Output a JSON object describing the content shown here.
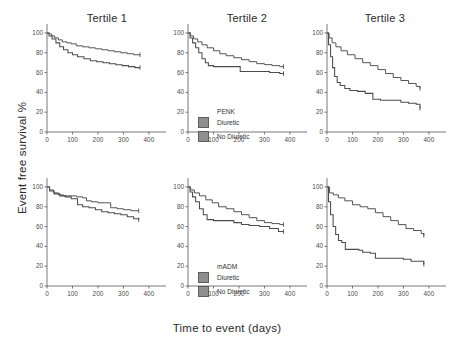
{
  "figure": {
    "xlabel": "Time to event (days)",
    "ylabel": "Event free survival %",
    "panel_titles": [
      "Tertile 1",
      "Tertile 2",
      "Tertile 3"
    ]
  },
  "legends": {
    "top": {
      "title": "PENK",
      "items": [
        {
          "label": "Diuretic",
          "color": "#8f8f8f"
        },
        {
          "label": "No Diuretic",
          "color": "#8f8f8f"
        }
      ]
    },
    "bottom": {
      "title": "mADM",
      "items": [
        {
          "label": "Diuretic",
          "color": "#8f8f8f"
        },
        {
          "label": "No Diuretic",
          "color": "#8f8f8f"
        }
      ]
    }
  },
  "axes": {
    "xticks": [
      0,
      100,
      200,
      300,
      400
    ],
    "xtick_labels": [
      "0",
      "100",
      "200",
      "300",
      "400"
    ],
    "yticks": [
      0,
      20,
      40,
      60,
      80,
      100
    ],
    "ytick_labels": [
      "0",
      "20",
      "40",
      "60",
      "80",
      "100"
    ],
    "xlim": [
      0,
      420
    ],
    "ylim": [
      0,
      105
    ]
  },
  "chart_data": [
    {
      "type": "line",
      "title": "Tertile 1",
      "biomarker": "PENK",
      "row": 0,
      "col": 0,
      "xlabel": "Time to event (days)",
      "ylabel": "Event free survival %",
      "xlim": [
        0,
        420
      ],
      "ylim": [
        0,
        105
      ],
      "grid": false,
      "legend_position": "none",
      "series": [
        {
          "name": "No Diuretic",
          "x": [
            0,
            8,
            18,
            30,
            45,
            60,
            78,
            95,
            115,
            140,
            165,
            190,
            215,
            240,
            265,
            290,
            315,
            340,
            365
          ],
          "y": [
            100,
            99,
            97,
            95,
            93,
            91,
            90,
            89,
            87,
            86,
            85,
            84,
            83,
            82,
            81,
            80,
            79,
            78,
            78
          ]
        },
        {
          "name": "Diuretic",
          "x": [
            0,
            8,
            20,
            35,
            50,
            65,
            82,
            100,
            120,
            145,
            170,
            195,
            220,
            245,
            270,
            295,
            320,
            345,
            365
          ],
          "y": [
            100,
            97,
            94,
            90,
            86,
            83,
            80,
            78,
            76,
            74,
            72,
            71,
            70,
            69,
            68,
            67,
            66,
            65,
            65
          ]
        }
      ]
    },
    {
      "type": "line",
      "title": "Tertile 2",
      "biomarker": "PENK",
      "row": 0,
      "col": 1,
      "xlabel": "Time to event (days)",
      "ylabel": "Event free survival %",
      "xlim": [
        0,
        420
      ],
      "ylim": [
        0,
        105
      ],
      "grid": false,
      "legend_position": "lower-center",
      "series": [
        {
          "name": "No Diuretic",
          "x": [
            0,
            10,
            22,
            38,
            55,
            75,
            100,
            125,
            150,
            180,
            210,
            240,
            270,
            300,
            330,
            360,
            375
          ],
          "y": [
            100,
            97,
            94,
            91,
            88,
            85,
            82,
            79,
            77,
            75,
            73,
            71,
            69,
            68,
            67,
            66,
            66
          ]
        },
        {
          "name": "Diuretic",
          "x": [
            0,
            8,
            18,
            30,
            42,
            55,
            68,
            80,
            100,
            130,
            160,
            190,
            205,
            240,
            280,
            320,
            360,
            375
          ],
          "y": [
            100,
            95,
            90,
            85,
            80,
            74,
            70,
            67,
            66,
            66,
            66,
            66,
            61,
            61,
            61,
            60,
            59,
            59
          ]
        }
      ]
    },
    {
      "type": "line",
      "title": "Tertile 3",
      "biomarker": "PENK",
      "row": 0,
      "col": 2,
      "xlabel": "Time to event (days)",
      "ylabel": "Event free survival %",
      "xlim": [
        0,
        420
      ],
      "ylim": [
        0,
        105
      ],
      "grid": false,
      "legend_position": "none",
      "series": [
        {
          "name": "No Diuretic",
          "x": [
            0,
            8,
            20,
            35,
            55,
            80,
            110,
            140,
            170,
            200,
            230,
            260,
            290,
            320,
            350,
            365
          ],
          "y": [
            100,
            95,
            90,
            86,
            82,
            78,
            74,
            70,
            67,
            63,
            59,
            55,
            52,
            49,
            46,
            44
          ]
        },
        {
          "name": "Diuretic",
          "x": [
            0,
            6,
            14,
            22,
            30,
            40,
            52,
            70,
            90,
            120,
            150,
            180,
            210,
            250,
            290,
            320,
            350,
            365
          ],
          "y": [
            100,
            88,
            76,
            65,
            56,
            50,
            47,
            44,
            42,
            41,
            39,
            33,
            32,
            32,
            30,
            29,
            28,
            24
          ]
        }
      ]
    },
    {
      "type": "line",
      "title": "Tertile 1",
      "biomarker": "mADM",
      "row": 1,
      "col": 0,
      "xlabel": "Time to event (days)",
      "ylabel": "Event free survival %",
      "xlim": [
        0,
        420
      ],
      "ylim": [
        0,
        105
      ],
      "grid": false,
      "legend_position": "none",
      "series": [
        {
          "name": "No Diuretic",
          "x": [
            0,
            10,
            25,
            45,
            65,
            90,
            115,
            140,
            155,
            175,
            200,
            225,
            250,
            275,
            300,
            330,
            360
          ],
          "y": [
            100,
            97,
            94,
            92,
            91,
            91,
            90,
            89,
            86,
            85,
            84,
            84,
            79,
            78,
            77,
            76,
            76
          ]
        },
        {
          "name": "Diuretic",
          "x": [
            0,
            10,
            28,
            50,
            72,
            95,
            120,
            140,
            165,
            190,
            215,
            240,
            265,
            290,
            315,
            340,
            360
          ],
          "y": [
            100,
            96,
            93,
            91,
            90,
            88,
            82,
            80,
            79,
            77,
            75,
            74,
            73,
            72,
            70,
            68,
            67
          ]
        }
      ]
    },
    {
      "type": "line",
      "title": "Tertile 2",
      "biomarker": "mADM",
      "row": 1,
      "col": 1,
      "xlabel": "Time to event (days)",
      "ylabel": "Event free survival %",
      "xlim": [
        0,
        420
      ],
      "ylim": [
        0,
        105
      ],
      "grid": false,
      "legend_position": "lower-center",
      "series": [
        {
          "name": "No Diuretic",
          "x": [
            0,
            10,
            25,
            45,
            70,
            95,
            120,
            150,
            180,
            210,
            240,
            270,
            300,
            330,
            360,
            375
          ],
          "y": [
            100,
            97,
            94,
            91,
            87,
            84,
            80,
            78,
            75,
            72,
            69,
            66,
            64,
            63,
            62,
            62
          ]
        },
        {
          "name": "Diuretic",
          "x": [
            0,
            8,
            18,
            30,
            45,
            60,
            75,
            100,
            140,
            180,
            210,
            240,
            280,
            320,
            355,
            375
          ],
          "y": [
            100,
            95,
            90,
            85,
            78,
            72,
            67,
            66,
            66,
            64,
            62,
            61,
            60,
            58,
            55,
            55
          ]
        }
      ]
    },
    {
      "type": "line",
      "title": "Tertile 3",
      "biomarker": "mADM",
      "row": 1,
      "col": 2,
      "xlabel": "Time to event (days)",
      "ylabel": "Event free survival %",
      "xlim": [
        0,
        420
      ],
      "ylim": [
        0,
        105
      ],
      "grid": false,
      "legend_position": "none",
      "series": [
        {
          "name": "No Diuretic",
          "x": [
            0,
            10,
            25,
            45,
            70,
            100,
            130,
            160,
            190,
            220,
            250,
            280,
            310,
            340,
            370,
            380
          ],
          "y": [
            100,
            94,
            92,
            89,
            86,
            82,
            80,
            78,
            74,
            70,
            66,
            62,
            58,
            56,
            53,
            51
          ]
        },
        {
          "name": "Diuretic",
          "x": [
            0,
            6,
            14,
            24,
            34,
            45,
            58,
            72,
            95,
            125,
            140,
            170,
            190,
            230,
            270,
            300,
            330,
            365,
            380
          ],
          "y": [
            100,
            85,
            72,
            60,
            52,
            46,
            44,
            37,
            37,
            36,
            34,
            33,
            28,
            28,
            28,
            27,
            25,
            25,
            22
          ]
        }
      ]
    }
  ]
}
